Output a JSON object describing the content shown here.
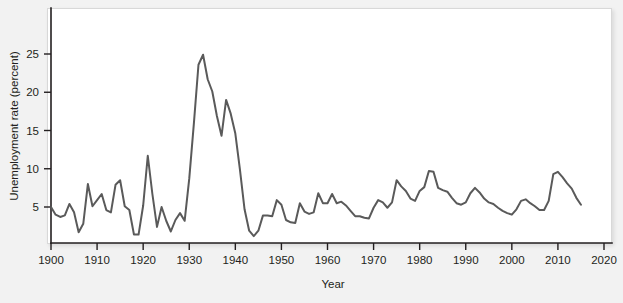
{
  "figure": {
    "background_color": "#f2f2f2",
    "panel_color": "#ffffff",
    "line_color": "#5a5a5a",
    "text_color": "#231f20",
    "ghost_watermark": ""
  },
  "chart_data": {
    "type": "line",
    "title": "",
    "xlabel": "Year",
    "ylabel": "Unemployment rate (percent)",
    "xlim": [
      1900,
      2020
    ],
    "ylim": [
      0,
      27
    ],
    "xticks": [
      1900,
      1910,
      1920,
      1930,
      1940,
      1950,
      1960,
      1970,
      1980,
      1990,
      2000,
      2010,
      2020
    ],
    "yticks": [
      5,
      10,
      15,
      20,
      25
    ],
    "xtick_labels": [
      "1900",
      "1910",
      "1920",
      "1930",
      "1940",
      "1950",
      "1960",
      "1970",
      "1980",
      "1990",
      "2000",
      "2010",
      "2020"
    ],
    "ytick_labels": [
      "5",
      "10",
      "15",
      "20",
      "25"
    ],
    "grid": false,
    "legend": false,
    "series": [
      {
        "name": "Unemployment rate",
        "color": "#5a5a5a",
        "x": [
          1900,
          1901,
          1902,
          1903,
          1904,
          1905,
          1906,
          1907,
          1908,
          1909,
          1910,
          1911,
          1912,
          1913,
          1914,
          1915,
          1916,
          1917,
          1918,
          1919,
          1920,
          1921,
          1922,
          1923,
          1924,
          1925,
          1926,
          1927,
          1928,
          1929,
          1930,
          1931,
          1932,
          1933,
          1934,
          1935,
          1936,
          1937,
          1938,
          1939,
          1940,
          1941,
          1942,
          1943,
          1944,
          1945,
          1946,
          1947,
          1948,
          1949,
          1950,
          1951,
          1952,
          1953,
          1954,
          1955,
          1956,
          1957,
          1958,
          1959,
          1960,
          1961,
          1962,
          1963,
          1964,
          1965,
          1966,
          1967,
          1968,
          1969,
          1970,
          1971,
          1972,
          1973,
          1974,
          1975,
          1976,
          1977,
          1978,
          1979,
          1980,
          1981,
          1982,
          1983,
          1984,
          1985,
          1986,
          1987,
          1988,
          1989,
          1990,
          1991,
          1992,
          1993,
          1994,
          1995,
          1996,
          1997,
          1998,
          1999,
          2000,
          2001,
          2002,
          2003,
          2004,
          2005,
          2006,
          2007,
          2008,
          2009,
          2010,
          2011,
          2012,
          2013,
          2014,
          2015
        ],
        "values": [
          5.0,
          4.0,
          3.7,
          3.9,
          5.4,
          4.3,
          1.7,
          2.8,
          8.0,
          5.1,
          5.9,
          6.7,
          4.6,
          4.3,
          7.9,
          8.5,
          5.1,
          4.6,
          1.4,
          1.4,
          5.2,
          11.7,
          6.7,
          2.4,
          5.0,
          3.2,
          1.8,
          3.3,
          4.2,
          3.2,
          8.7,
          15.9,
          23.6,
          24.9,
          21.7,
          20.1,
          16.9,
          14.3,
          19.0,
          17.2,
          14.6,
          9.9,
          4.7,
          1.9,
          1.2,
          1.9,
          3.9,
          3.9,
          3.8,
          5.9,
          5.3,
          3.3,
          3.0,
          2.9,
          5.5,
          4.4,
          4.1,
          4.3,
          6.8,
          5.5,
          5.5,
          6.7,
          5.5,
          5.7,
          5.2,
          4.5,
          3.8,
          3.8,
          3.6,
          3.5,
          4.9,
          5.9,
          5.6,
          4.9,
          5.6,
          8.5,
          7.7,
          7.1,
          6.1,
          5.8,
          7.1,
          7.6,
          9.7,
          9.6,
          7.5,
          7.2,
          7.0,
          6.2,
          5.5,
          5.3,
          5.6,
          6.8,
          7.5,
          6.9,
          6.1,
          5.6,
          5.4,
          4.9,
          4.5,
          4.2,
          4.0,
          4.7,
          5.8,
          6.0,
          5.5,
          5.1,
          4.6,
          4.6,
          5.8,
          9.3,
          9.6,
          8.9,
          8.1,
          7.4,
          6.2,
          5.3
        ]
      }
    ]
  }
}
